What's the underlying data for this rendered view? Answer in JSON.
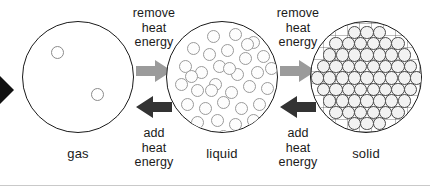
{
  "diagram": {
    "background_color": "#ffffff",
    "outline_color": "#1a1a1a"
  },
  "edge_marker": {
    "icon": "arrow-right-partial-icon",
    "color": "#111111",
    "note": "black arrowhead clipped by left image edge"
  },
  "states": [
    {
      "key": "gas",
      "label": "gas",
      "particle_arrangement": "sparse-random",
      "particle_count": 2,
      "particle_color": "#8a8a8a",
      "particles": [
        {
          "x": 28,
          "y": 24,
          "d": 13
        },
        {
          "x": 68,
          "y": 66,
          "d": 13
        }
      ]
    },
    {
      "key": "liquid",
      "label": "liquid",
      "particle_arrangement": "dense-random",
      "particle_count": 34,
      "particle_color": "#9a9a9a",
      "particles": [
        {
          "x": 40,
          "y": 8,
          "d": 13
        },
        {
          "x": 62,
          "y": 6,
          "d": 13
        },
        {
          "x": 80,
          "y": 14,
          "d": 13
        },
        {
          "x": 20,
          "y": 20,
          "d": 13
        },
        {
          "x": 36,
          "y": 26,
          "d": 13
        },
        {
          "x": 54,
          "y": 22,
          "d": 13
        },
        {
          "x": 72,
          "y": 30,
          "d": 13
        },
        {
          "x": 90,
          "y": 28,
          "d": 13
        },
        {
          "x": 12,
          "y": 38,
          "d": 13
        },
        {
          "x": 28,
          "y": 44,
          "d": 13
        },
        {
          "x": 46,
          "y": 38,
          "d": 13
        },
        {
          "x": 64,
          "y": 46,
          "d": 13
        },
        {
          "x": 84,
          "y": 44,
          "d": 13
        },
        {
          "x": 98,
          "y": 40,
          "d": 13
        },
        {
          "x": 8,
          "y": 56,
          "d": 13
        },
        {
          "x": 24,
          "y": 62,
          "d": 13
        },
        {
          "x": 42,
          "y": 56,
          "d": 13
        },
        {
          "x": 58,
          "y": 64,
          "d": 13
        },
        {
          "x": 76,
          "y": 58,
          "d": 13
        },
        {
          "x": 94,
          "y": 60,
          "d": 13
        },
        {
          "x": 14,
          "y": 76,
          "d": 13
        },
        {
          "x": 32,
          "y": 80,
          "d": 13
        },
        {
          "x": 50,
          "y": 74,
          "d": 13
        },
        {
          "x": 68,
          "y": 80,
          "d": 13
        },
        {
          "x": 86,
          "y": 76,
          "d": 13
        },
        {
          "x": 24,
          "y": 94,
          "d": 13
        },
        {
          "x": 44,
          "y": 92,
          "d": 13
        },
        {
          "x": 62,
          "y": 96,
          "d": 13
        },
        {
          "x": 80,
          "y": 92,
          "d": 13
        },
        {
          "x": 38,
          "y": 62,
          "d": 13
        },
        {
          "x": 56,
          "y": 40,
          "d": 13
        },
        {
          "x": 18,
          "y": 48,
          "d": 13
        },
        {
          "x": 74,
          "y": 16,
          "d": 13
        },
        {
          "x": 50,
          "y": 108,
          "d": 13
        }
      ]
    },
    {
      "key": "solid",
      "label": "solid",
      "particle_arrangement": "close-packed-lattice",
      "particle_count": 76,
      "particle_color": "#4a4a4a",
      "lattice": {
        "rows": 9,
        "spacing": 12.4,
        "diameter": 13.4
      }
    }
  ],
  "transitions": [
    {
      "key": "gas-to-liquid",
      "direction": "right",
      "arrow_icon": "arrow-right-icon",
      "arrow_color": "#9b9b9b",
      "label_lines": [
        "remove",
        "heat",
        "energy"
      ],
      "label_text": "remove heat energy"
    },
    {
      "key": "liquid-to-gas",
      "direction": "left",
      "arrow_icon": "arrow-left-icon",
      "arrow_color": "#333333",
      "label_lines": [
        "add",
        "heat",
        "energy"
      ],
      "label_text": "add heat energy"
    },
    {
      "key": "liquid-to-solid",
      "direction": "right",
      "arrow_icon": "arrow-right-icon",
      "arrow_color": "#9b9b9b",
      "label_lines": [
        "remove",
        "heat",
        "energy"
      ],
      "label_text": "remove heat energy"
    },
    {
      "key": "solid-to-liquid",
      "direction": "left",
      "arrow_icon": "arrow-left-icon",
      "arrow_color": "#333333",
      "label_lines": [
        "add",
        "heat",
        "energy"
      ],
      "label_text": "add heat energy"
    }
  ],
  "labels": {
    "remove_l1": "remove",
    "remove_l2": "heat",
    "remove_l3": "energy",
    "add_l1": "add",
    "add_l2": "heat",
    "add_l3": "energy",
    "gas": "gas",
    "liquid": "liquid",
    "solid": "solid"
  }
}
